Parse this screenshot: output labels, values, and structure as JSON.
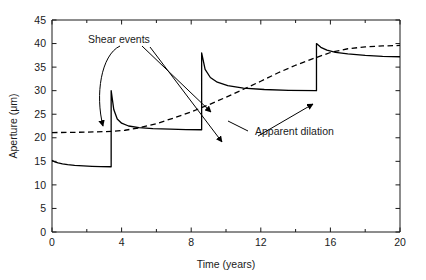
{
  "chart_data": {
    "type": "line",
    "title": "",
    "xlabel": "Time (years)",
    "ylabel": "Aperture (μm)",
    "xlim": [
      0,
      20
    ],
    "ylim": [
      0,
      45
    ],
    "xticks": [
      0,
      4,
      8,
      12,
      16,
      20
    ],
    "xtick_labels": [
      "0",
      "4",
      "8",
      "12",
      "16",
      "20"
    ],
    "xminor_ticks": [
      2,
      6,
      10,
      14,
      18
    ],
    "yticks": [
      0,
      5,
      10,
      15,
      20,
      25,
      30,
      35,
      40,
      45
    ],
    "ytick_labels": [
      "0",
      "5",
      "10",
      "15",
      "20",
      "25",
      "30",
      "35",
      "40",
      "45"
    ],
    "grid": false,
    "legend_position": "none",
    "series": [
      {
        "name": "Aperture (shear-event sawtooth)",
        "style": "solid",
        "color": "#000000",
        "description": "Sawtooth: creep-closure decay punctuated by three instantaneous shear-dilation jumps",
        "shear_event_times": [
          3.4,
          8.6,
          15.2
        ],
        "shear_event_pre_values": [
          13.8,
          21.7,
          30.0
        ],
        "shear_event_post_values": [
          30.0,
          38.0,
          40.0
        ],
        "points": [
          [
            0.0,
            15.2
          ],
          [
            0.15,
            14.9
          ],
          [
            0.35,
            14.65
          ],
          [
            0.6,
            14.45
          ],
          [
            0.9,
            14.3
          ],
          [
            1.3,
            14.15
          ],
          [
            1.8,
            14.03
          ],
          [
            2.3,
            13.95
          ],
          [
            2.8,
            13.89
          ],
          [
            3.4,
            13.85
          ],
          [
            3.4,
            30.0
          ],
          [
            3.55,
            26.0
          ],
          [
            3.75,
            24.0
          ],
          [
            4.0,
            23.1
          ],
          [
            4.4,
            22.5
          ],
          [
            5.0,
            22.15
          ],
          [
            5.8,
            21.95
          ],
          [
            6.8,
            21.82
          ],
          [
            7.7,
            21.75
          ],
          [
            8.6,
            21.7
          ],
          [
            8.6,
            38.0
          ],
          [
            8.8,
            34.5
          ],
          [
            9.1,
            32.8
          ],
          [
            9.5,
            31.8
          ],
          [
            10.1,
            31.05
          ],
          [
            11.0,
            30.55
          ],
          [
            12.2,
            30.25
          ],
          [
            13.6,
            30.08
          ],
          [
            15.2,
            30.0
          ],
          [
            15.2,
            40.0
          ],
          [
            15.45,
            39.2
          ],
          [
            15.8,
            38.6
          ],
          [
            16.3,
            38.15
          ],
          [
            17.0,
            37.8
          ],
          [
            18.0,
            37.5
          ],
          [
            19.0,
            37.3
          ],
          [
            20.0,
            37.2
          ]
        ]
      },
      {
        "name": "Apparent dilation",
        "style": "dashed",
        "color": "#000000",
        "description": "Smooth monotonic rise of the time-averaged apparent dilation",
        "points": [
          [
            0.0,
            21.1
          ],
          [
            1.0,
            21.15
          ],
          [
            2.0,
            21.2
          ],
          [
            3.0,
            21.3
          ],
          [
            3.6,
            21.4
          ],
          [
            4.2,
            21.6
          ],
          [
            5.0,
            22.1
          ],
          [
            6.0,
            23.0
          ],
          [
            7.0,
            24.2
          ],
          [
            8.0,
            25.5
          ],
          [
            9.0,
            27.0
          ],
          [
            10.0,
            28.6
          ],
          [
            11.0,
            30.3
          ],
          [
            12.0,
            32.0
          ],
          [
            13.0,
            33.8
          ],
          [
            14.0,
            35.4
          ],
          [
            15.0,
            36.8
          ],
          [
            16.0,
            38.1
          ],
          [
            17.0,
            38.9
          ],
          [
            18.0,
            39.3
          ],
          [
            19.0,
            39.5
          ],
          [
            20.0,
            39.6
          ]
        ]
      }
    ],
    "annotations": [
      {
        "id": "shear-events-label",
        "text": "Shear events",
        "x": 2.1,
        "y": 41.3,
        "arrow_targets": [
          [
            3.35,
            21.8
          ],
          [
            8.4,
            31.0
          ],
          [
            15.0,
            34.2
          ]
        ]
      },
      {
        "id": "apparent-dilation-label",
        "text": "Apparent dilation",
        "x": 11.6,
        "y": 21.4,
        "leader_to": [
          10.4,
          23.2
        ]
      }
    ]
  }
}
